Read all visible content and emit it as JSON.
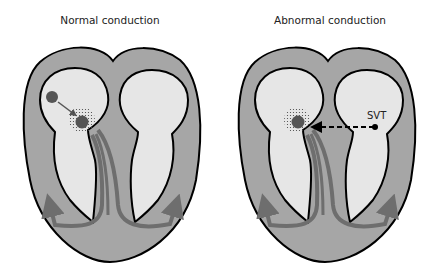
{
  "panels": [
    {
      "title": "Normal conduction"
    },
    {
      "title": "Abnormal conduction",
      "annotation": "SVT"
    }
  ],
  "colors": {
    "myocardium": "#a6a6a6",
    "chamber": "#e6e6e6",
    "outline": "#000000",
    "conduction": "#6e6e6e",
    "node": "#555555",
    "background": "#ffffff"
  }
}
